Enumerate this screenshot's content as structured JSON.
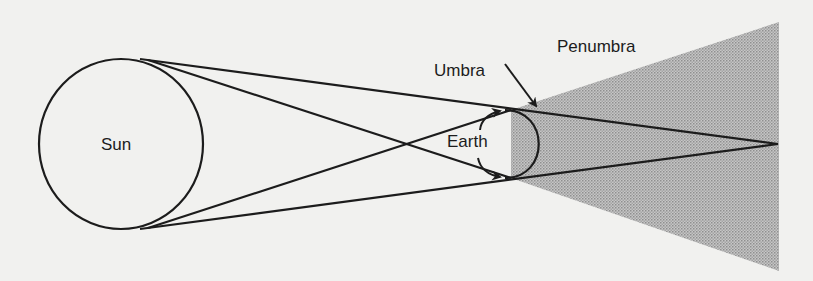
{
  "diagram": {
    "labels": {
      "sun": "Sun",
      "earth": "Earth",
      "umbra": "Umbra",
      "penumbra": "Penumbra"
    },
    "colors": {
      "background": "#f1f1ef",
      "stroke": "#1c1c1c",
      "shadow_fill": "#b9b9b9"
    },
    "shapes": {
      "sun": {
        "cx": 121,
        "cy": 144,
        "rx": 82,
        "ry": 85
      },
      "earth": {
        "cx": 511,
        "cy": 144,
        "r": 34
      },
      "shadow_polygon": [
        [
          511,
          110
        ],
        [
          779,
          22
        ],
        [
          779,
          271
        ],
        [
          511,
          178
        ]
      ],
      "umbra_apex": [
        778,
        144
      ],
      "lines": [
        {
          "from": [
            142,
            59
          ],
          "to": [
            778,
            144
          ],
          "name": "sun-top-to-umbra-apex"
        },
        {
          "from": [
            142,
            229
          ],
          "to": [
            778,
            144
          ],
          "name": "sun-bottom-to-umbra-apex"
        },
        {
          "from": [
            150,
            60
          ],
          "to": [
            511,
            178
          ],
          "name": "sun-top-to-earth-bottom"
        },
        {
          "from": [
            150,
            228
          ],
          "to": [
            511,
            110
          ],
          "name": "sun-bottom-to-earth-top"
        }
      ]
    }
  }
}
